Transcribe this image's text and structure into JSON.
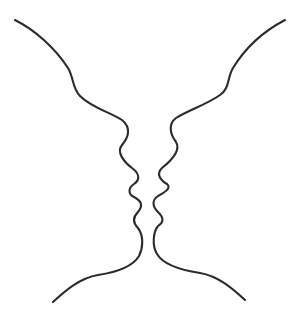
{
  "figure": {
    "background_color": "#ffffff",
    "line_color": "#2b2b2b",
    "elements": [
      {
        "name": "left-face-profile",
        "facing": "right"
      },
      {
        "name": "right-face-profile",
        "facing": "left"
      }
    ]
  }
}
